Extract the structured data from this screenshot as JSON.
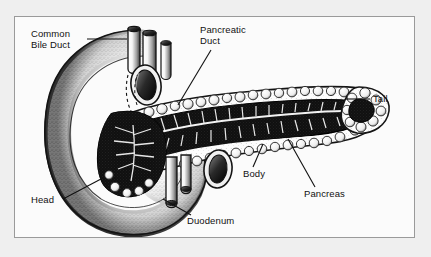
{
  "figure": {
    "style": "black-and-white stippled line engraving",
    "border_color": "#9a9a9a",
    "background_color": "#fbfbfb",
    "page_background_color": "#efefef",
    "ink_color": "#111111"
  },
  "labels": {
    "common_bile_duct": "Common\nBile Duct",
    "pancreatic_duct": "Pancreatic\nDuct",
    "tail": "Tail",
    "body": "Body",
    "pancreas": "Pancreas",
    "head": "Head",
    "duodenum": "Duodenum"
  },
  "structures": [
    {
      "name": "common-bile-duct",
      "kind": "cut-tube",
      "note": "upper-left tube entering from top"
    },
    {
      "name": "pancreatic-duct",
      "kind": "branching-duct",
      "note": "white duct tree inside dark gland"
    },
    {
      "name": "duodenum",
      "kind": "c-loop",
      "note": "curved bowel around pancreatic head"
    },
    {
      "name": "pancreas-head",
      "kind": "gland-region"
    },
    {
      "name": "pancreas-body",
      "kind": "gland-region"
    },
    {
      "name": "pancreas-tail",
      "kind": "gland-region"
    }
  ]
}
